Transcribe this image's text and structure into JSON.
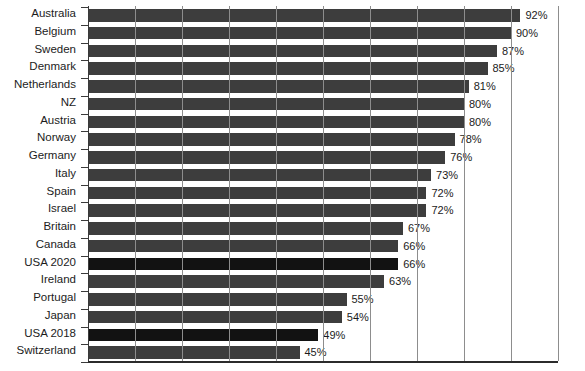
{
  "chart_data": {
    "type": "bar",
    "orientation": "horizontal",
    "title": "",
    "subtitle": "",
    "xlabel": "",
    "ylabel": "",
    "xlim": [
      0,
      100
    ],
    "grid": true,
    "gridline_step": 10,
    "legend_position": "none",
    "value_suffix": "%",
    "categories": [
      "Australia",
      "Belgium",
      "Sweden",
      "Denmark",
      "Netherlands",
      "NZ",
      "Austria",
      "Norway",
      "Germany",
      "Italy",
      "Spain",
      "Israel",
      "Britain",
      "Canada",
      "USA 2020",
      "Ireland",
      "Portugal",
      "Japan",
      "USA 2018",
      "Switzerland"
    ],
    "values": [
      92,
      90,
      87,
      85,
      81,
      80,
      80,
      78,
      76,
      73,
      72,
      72,
      67,
      66,
      66,
      63,
      55,
      54,
      49,
      45
    ],
    "value_labels": [
      "92%",
      "90%",
      "87%",
      "85%",
      "81%",
      "80%",
      "80%",
      "78%",
      "76%",
      "73%",
      "72%",
      "72%",
      "67%",
      "66%",
      "66%",
      "63%",
      "55%",
      "54%",
      "49%",
      "45%"
    ],
    "highlighted": [
      "USA 2020",
      "USA 2018"
    ],
    "colors": {
      "bar": "#3d3d3d",
      "bar_highlight": "#121212",
      "gridline": "#8d8d8d",
      "axis": "#2b2b2b",
      "text": "#1c1c1c",
      "background": "#ffffff"
    }
  },
  "caption": ""
}
